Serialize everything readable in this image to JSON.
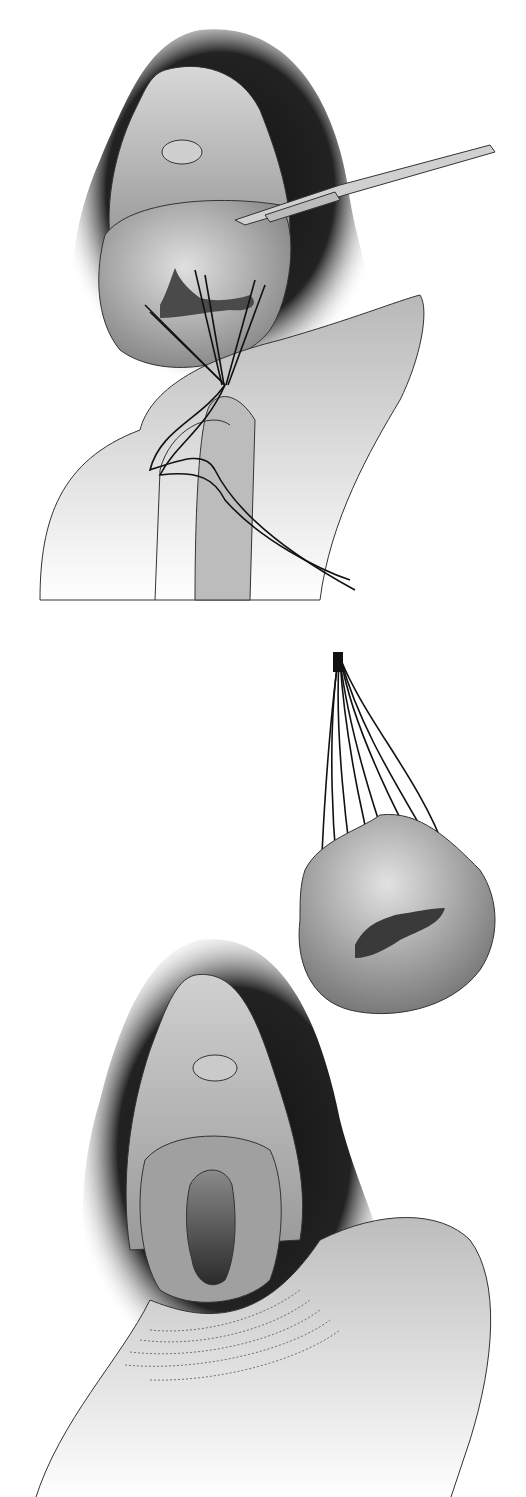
{
  "figure": {
    "type": "medical-illustration",
    "style": "grayscale line and tone",
    "panels": [
      {
        "id": "top",
        "depicts": "surgical field with forceps retracting tissue; multiple sutures gathered and held by fingers"
      },
      {
        "id": "bottom",
        "depicts": "excised tissue mass suspended by gathered sutures above surgical site showing open cavity"
      }
    ],
    "colors": {
      "background": "#ffffff",
      "shadow": "#1a1a1a",
      "tissue_light": "#d4d4d4",
      "tissue_mid": "#a8a8a8",
      "tissue_dark": "#6a6a6a",
      "cavity": "#3a3a3a",
      "skin": "#c8c8c8",
      "line": "#222222"
    }
  }
}
